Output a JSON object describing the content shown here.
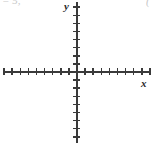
{
  "figure": {
    "kind": "blank-cartesian-coordinate-plane",
    "background_color": "#ffffff",
    "axis_color": "#3a3a3a",
    "label_color": "#2a2a2a",
    "fragment_color": "#9a9a9a",
    "x_axis_label": "x",
    "y_axis_label": "y",
    "top_fragment_left": "= 5,",
    "top_fragment_right": "("
  },
  "chart_data": {
    "type": "scatter",
    "title": "",
    "subtitle": "",
    "xlabel": "x",
    "ylabel": "y",
    "xlim": [
      -9,
      9
    ],
    "ylim": [
      -9,
      9
    ],
    "grid": false,
    "legend": false,
    "legend_position": "none",
    "x_tick_step": 1,
    "y_tick_step": 1,
    "x_tick_labels": [],
    "y_tick_labels": [],
    "x_ticks": [
      -9,
      -8,
      -7,
      -6,
      -5,
      -4,
      -3,
      -2,
      -1,
      1,
      2,
      3,
      4,
      5,
      6,
      7,
      8,
      9
    ],
    "y_ticks": [
      -8,
      -7,
      -6,
      -5,
      -4,
      -3,
      -2,
      -1,
      1,
      2,
      3,
      4,
      5,
      6,
      7,
      8
    ],
    "series": [],
    "annotations": [],
    "origin_px": {
      "x": 77,
      "y": 72
    },
    "pixels_per_unit": 8.1
  },
  "geometry": {
    "x_axis": {
      "left": 4,
      "top": 71,
      "width": 147
    },
    "y_axis": {
      "left": 76,
      "top": 2,
      "height": 141
    },
    "tick_length": 7
  }
}
